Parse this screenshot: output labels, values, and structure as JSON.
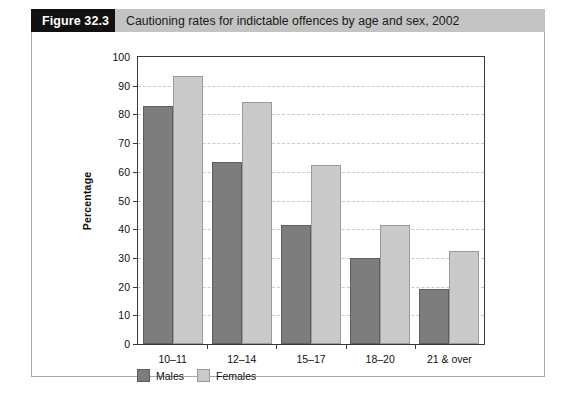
{
  "figure": {
    "number_label": "Figure 32.3",
    "caption": "Cautioning rates for indictable offences by age and sex, 2002"
  },
  "colors": {
    "males": "#7d7d7d",
    "females": "#cacaca",
    "banner_number_bg": "#111111",
    "banner_caption_bg": "#c3c3c3",
    "axis": "#3a3a3a",
    "gridline": "#c9c9d6"
  },
  "chart_data": {
    "type": "bar",
    "title": "Cautioning rates for indictable offences by age and sex, 2002",
    "xlabel": "",
    "ylabel": "Percentage",
    "ylim": [
      0,
      100
    ],
    "yticks": [
      0,
      10,
      20,
      30,
      40,
      50,
      60,
      70,
      80,
      90,
      100
    ],
    "ytick_labels": [
      "0",
      "10",
      "20",
      "30",
      "40",
      "50",
      "60",
      "70",
      "80",
      "90",
      "100"
    ],
    "grid": true,
    "legend_position": "below-axis-left",
    "categories": [
      "10–11",
      "12–14",
      "15–17",
      "18–20",
      "21 & over"
    ],
    "series": [
      {
        "name": "Males",
        "values": [
          83.0,
          63.5,
          41.5,
          29.8,
          19.0
        ]
      },
      {
        "name": "Females",
        "values": [
          93.5,
          84.5,
          62.5,
          41.3,
          32.3
        ]
      }
    ]
  }
}
